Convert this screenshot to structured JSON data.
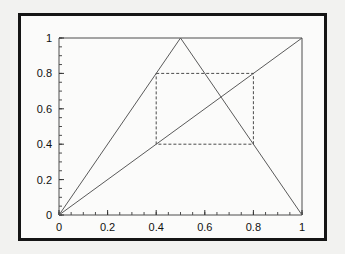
{
  "figure": {
    "background_color": "#fbfbfa",
    "page_color": "#f2f2f0",
    "border_color": "#151515",
    "title": ""
  },
  "chart_data": {
    "type": "line",
    "title": "",
    "xlabel": "",
    "ylabel": "",
    "xlim": [
      0,
      1
    ],
    "ylim": [
      0,
      1
    ],
    "grid": false,
    "legend": null,
    "xticks": [
      0,
      0.2,
      0.4,
      0.6,
      0.8,
      1
    ],
    "xticklabels": [
      "0",
      "0.2",
      "0.4",
      "0.6",
      "0.8",
      "1"
    ],
    "yticks": [
      0,
      0.2,
      0.4,
      0.6,
      0.8,
      1
    ],
    "yticklabels": [
      "0",
      "0.2",
      "0.4",
      "0.6",
      "0.8",
      "1"
    ],
    "minor_tick_step": 0.05,
    "series": [
      {
        "name": "tent-map",
        "style": "solid",
        "color": "#5a5a5a",
        "x": [
          0,
          0.5,
          1
        ],
        "y": [
          0,
          1,
          0
        ]
      },
      {
        "name": "identity-diagonal",
        "style": "solid",
        "color": "#5a5a5a",
        "x": [
          0,
          1
        ],
        "y": [
          0,
          1
        ]
      }
    ],
    "annotations": [
      {
        "name": "dashed-box",
        "type": "rectangle",
        "style": "dashed",
        "color": "#4a4a4a",
        "x0": 0.4,
        "y0": 0.4,
        "x1": 0.8,
        "y1": 0.8
      }
    ]
  },
  "axis_labels": {
    "x": [
      "0",
      "0.2",
      "0.4",
      "0.6",
      "0.8",
      "1"
    ],
    "y": [
      "0",
      "0.2",
      "0.4",
      "0.6",
      "0.8",
      "1"
    ]
  }
}
